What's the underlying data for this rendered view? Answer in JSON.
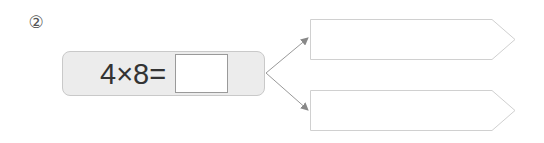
{
  "problem": {
    "number": "②",
    "expression": "4×8=",
    "answer_value": ""
  },
  "outputs": [
    {
      "value": ""
    },
    {
      "value": ""
    }
  ],
  "colors": {
    "box_fill": "#ececec",
    "box_border": "#c9c9c9",
    "arrow": "#888888",
    "pentagon_border": "#cfcfcf"
  }
}
